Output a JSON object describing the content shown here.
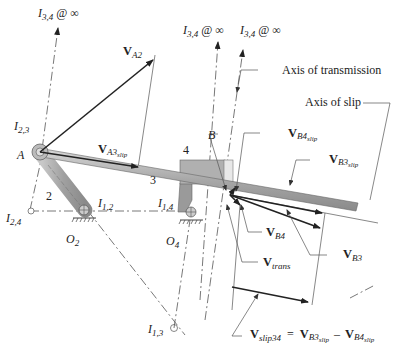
{
  "diagram": {
    "instant_centers": {
      "i34_a": {
        "name": "I",
        "sub": "3,4",
        "suffix": "@ ∞"
      },
      "i34_b": {
        "name": "I",
        "sub": "3,4",
        "suffix": "@ ∞"
      },
      "i34_c": {
        "name": "I",
        "sub": "3,4",
        "suffix": "@ ∞"
      },
      "i23": {
        "name": "I",
        "sub": "2,3"
      },
      "i24": {
        "name": "I",
        "sub": "2,4"
      },
      "i12": {
        "name": "I",
        "sub": "1,2"
      },
      "i14": {
        "name": "I",
        "sub": "1,4"
      },
      "i13": {
        "name": "I",
        "sub": "1,3"
      }
    },
    "points": {
      "A": "A",
      "B": "B",
      "O2": {
        "name": "O",
        "sub": "2"
      },
      "O4": {
        "name": "O",
        "sub": "4"
      }
    },
    "links": {
      "link2": "2",
      "link3": "3",
      "link4": "4"
    },
    "axes": {
      "transmission": "Axis of transmission",
      "slip": "Axis of slip"
    },
    "vectors": {
      "vA2": {
        "name": "V",
        "sub": "A2"
      },
      "vA3slip": {
        "name": "V",
        "sub": "A3",
        "subsub": "slip"
      },
      "vB4slip": {
        "name": "V",
        "sub": "B4",
        "subsub": "slip"
      },
      "vB3slip": {
        "name": "V",
        "sub": "B3",
        "subsub": "slip"
      },
      "vB4": {
        "name": "V",
        "sub": "B4"
      },
      "vB3": {
        "name": "V",
        "sub": "B3"
      },
      "vtrans": {
        "name": "V",
        "sub": "trans"
      }
    },
    "equation": {
      "lhs": "V",
      "lhs_sub": "slip34",
      "eq": "=",
      "t1": "V",
      "t1_sub": "B3",
      "t1_subsub": "slip",
      "minus": "–",
      "t2": "V",
      "t2_sub": "B4",
      "t2_subsub": "slip"
    }
  }
}
